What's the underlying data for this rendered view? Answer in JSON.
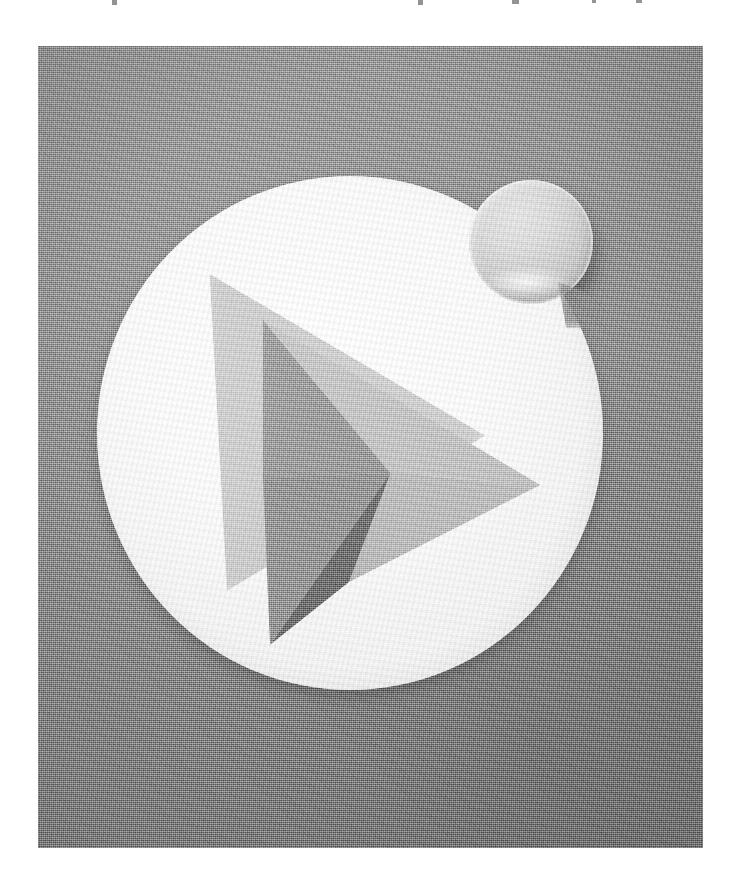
{
  "page": {
    "background_color": "#ffffff",
    "width": 743,
    "height": 896
  },
  "cut_text_line": {
    "description": "faint cut-off descenders of a text line above the figure",
    "marks": [
      {
        "x": 112,
        "width": 5
      },
      {
        "x": 418,
        "width": 5
      },
      {
        "x": 512,
        "width": 7
      },
      {
        "x": 592,
        "width": 4
      },
      {
        "x": 636,
        "width": 6
      }
    ]
  },
  "photo": {
    "alt_text": "Photograph of a Google Play style app icon badge",
    "subject": "play-store-icon-disc",
    "frame": {
      "left": 38,
      "top": 46,
      "width": 665,
      "height": 802
    },
    "background_color": "#8c8c8c",
    "texture": "halftone-dither",
    "is_grayscale": true
  },
  "icon": {
    "name": "google-play-style-icon",
    "disc": {
      "shape": "circle",
      "color": "#ffffff",
      "center_x": 350,
      "center_y": 429,
      "radius": 253
    },
    "play_triangle": {
      "name": "play-triangle",
      "facet_count": 4,
      "facets": [
        {
          "name": "upper-left-facet",
          "color": "#9d9d9d"
        },
        {
          "name": "upper-right-facet",
          "color": "#c6c6c6"
        },
        {
          "name": "lower-right-facet",
          "color": "#bdbdbd"
        },
        {
          "name": "lower-wedge-facet",
          "color": "#6f6f6f"
        }
      ],
      "apex_top": {
        "x": 226,
        "y": 270
      },
      "apex_right": {
        "x": 500,
        "y": 435
      },
      "apex_bottom": {
        "x": 233,
        "y": 595
      }
    },
    "badge": {
      "name": "circular-badge",
      "shape": "circle",
      "color": "#dcdcdc",
      "center_x": 531,
      "center_y": 242,
      "radius": 62,
      "position": "overlapping-top-right-of-disc",
      "has_gloss_highlight": true
    }
  },
  "colors": {
    "plate_gray": "#8c8c8c",
    "disc_white": "#ffffff",
    "badge_gray": "#dcdcdc",
    "facet_light": "#c6c6c6",
    "facet_mid": "#9d9d9d",
    "facet_dark": "#6f6f6f",
    "page_white": "#ffffff"
  }
}
